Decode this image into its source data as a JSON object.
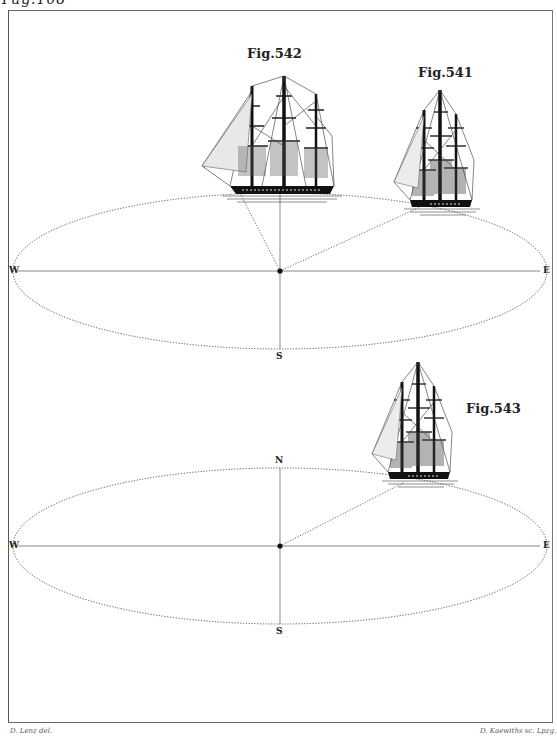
{
  "page": {
    "header": "Pag.108",
    "credit_left": "D. Lenz del.",
    "credit_right": "D. Kaewiths sc. Lpzg."
  },
  "figures": [
    {
      "id": "fig-542",
      "label": "Fig.542",
      "description": "Three-masted full-rigged ship seen broadside, positioned at north edge of ellipse"
    },
    {
      "id": "fig-541",
      "label": "Fig.541",
      "description": "Three-masted ship seen at angle, positioned on northeast edge of ellipse"
    },
    {
      "id": "fig-543",
      "label": "Fig.543",
      "description": "Three-masted ship seen at angle, positioned on northeast edge of lower ellipse"
    }
  ],
  "diagrams": {
    "upper": {
      "west": "W",
      "east": "E",
      "south": "S"
    },
    "lower": {
      "north": "N",
      "west": "W",
      "east": "E",
      "south": "S"
    }
  },
  "colors": {
    "ink": "#1a1a1a",
    "paper": "#ffffff",
    "frame": "#666666"
  }
}
